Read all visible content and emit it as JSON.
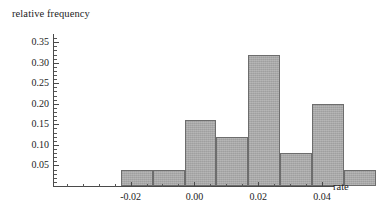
{
  "chart_data": {
    "type": "bar",
    "title": "",
    "subtitle": "",
    "xlabel": "rate",
    "ylabel": "relative frequency",
    "bin_width": 0.01,
    "bin_edges": [
      -0.04,
      -0.03,
      -0.02,
      -0.01,
      0.0,
      0.01,
      0.02,
      0.03,
      0.04
    ],
    "categories": [
      "-0.04 to -0.03",
      "-0.03 to -0.02",
      "-0.02 to -0.01",
      "-0.01 to 0.00",
      "0.00 to 0.01",
      "0.01 to 0.02",
      "0.02 to 0.03",
      "0.03 to 0.04"
    ],
    "values": [
      0.04,
      0.04,
      0.16,
      0.12,
      0.32,
      0.08,
      0.2,
      0.04
    ],
    "bar_color": "#a8a8a8",
    "bar_edge_color": "#6d6d6d",
    "xlim": [
      -0.044,
      0.0425
    ],
    "ylim": [
      0,
      0.3675
    ],
    "grid": false,
    "legend": null,
    "y_ticks": [
      0.05,
      0.1,
      0.15,
      0.2,
      0.25,
      0.3,
      0.35
    ],
    "y_tick_labels": [
      "0.05",
      "0.10",
      "0.15",
      "0.20",
      "0.25",
      "0.30",
      "0.35"
    ],
    "y_minor_ticks": [
      0.01,
      0.02,
      0.03,
      0.04,
      0.06,
      0.07,
      0.08,
      0.09,
      0.11,
      0.12,
      0.13,
      0.14,
      0.16,
      0.17,
      0.18,
      0.19,
      0.21,
      0.22,
      0.23,
      0.24,
      0.26,
      0.27,
      0.28,
      0.29,
      0.31,
      0.32,
      0.33,
      0.34,
      0.36
    ],
    "x_ticks": [
      -0.02,
      0.0,
      0.02,
      0.04
    ],
    "x_tick_labels": [
      "-0.02",
      "0.00",
      "0.02",
      "0.04"
    ],
    "x_minor_ticks": [
      -0.04,
      -0.035,
      -0.03,
      -0.025,
      -0.015,
      -0.01,
      -0.005,
      0.005,
      0.01,
      0.015,
      0.025,
      0.03,
      0.035
    ]
  }
}
